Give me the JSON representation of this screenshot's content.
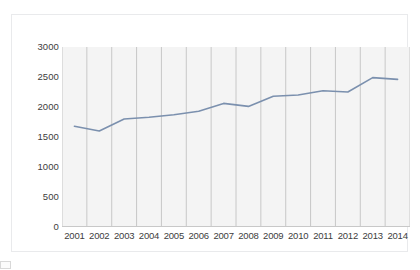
{
  "chart_data": {
    "type": "line",
    "title": "",
    "xlabel": "",
    "ylabel": "",
    "categories": [
      "2001",
      "2002",
      "2003",
      "2004",
      "2005",
      "2006",
      "2007",
      "2008",
      "2009",
      "2010",
      "2011",
      "2012",
      "2013",
      "2014"
    ],
    "values": [
      1680,
      1600,
      1800,
      1830,
      1870,
      1930,
      2060,
      2010,
      2180,
      2200,
      2270,
      2250,
      2490,
      2460
    ],
    "series": [
      {
        "name": "series-1",
        "values": [
          1680,
          1600,
          1800,
          1830,
          1870,
          1930,
          2060,
          2010,
          2180,
          2200,
          2270,
          2250,
          2490,
          2460
        ]
      }
    ],
    "ylim": [
      0,
      3000
    ],
    "yticks": [
      0,
      500,
      1000,
      1500,
      2000,
      2500,
      3000
    ],
    "ytick_labels": [
      "0",
      "500",
      "1000",
      "1500",
      "2000",
      "2500",
      "3000"
    ],
    "xtick_labels": [
      "2001",
      "2002",
      "2003",
      "2004",
      "2005",
      "2006",
      "2007",
      "2008",
      "2009",
      "2010",
      "2011",
      "2012",
      "2013",
      "2014"
    ],
    "grid": "vertical",
    "legend": "none",
    "line_color": "#7b90ae",
    "plot_background": "#f4f4f4",
    "gridline_color": "#bdbdbd",
    "axis_color": "#c8c8c8",
    "text_color": "#3d3d3d"
  },
  "caption": {
    "text": ""
  }
}
